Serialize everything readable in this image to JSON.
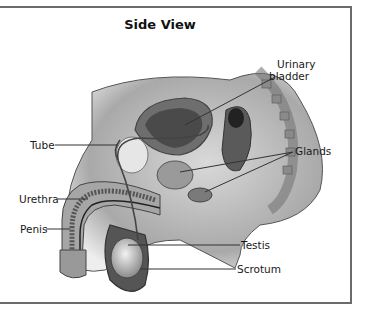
{
  "title": "Side View",
  "labels": {
    "urinary_bladder_line1": "Urinary",
    "urinary_bladder_line2": "bladder",
    "glands": "Glands",
    "tube": "Tube",
    "urethra": "Urethra",
    "penis": "Penis",
    "testis": "Testis",
    "scrotum": "Scrotum"
  },
  "colors": {
    "frame_border": "#6b6b6b",
    "label_text": "#1a1a1a",
    "leader_line": "#333333"
  }
}
